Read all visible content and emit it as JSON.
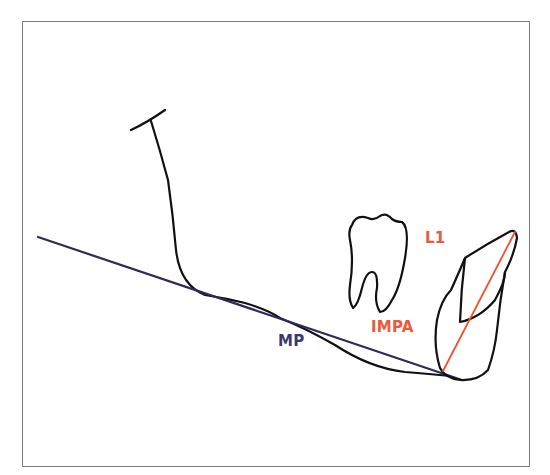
{
  "diagram": {
    "labels": {
      "l1": "L1",
      "impa": "IMPA",
      "mp": "MP"
    },
    "colors": {
      "frame": "#7a7a7a",
      "outline": "#111111",
      "mandibular_plane": "#2e2b5c",
      "incisor_axis": "#f0502a",
      "label_red": "#e85a3a",
      "label_navy": "#3c3a6a"
    },
    "elements": [
      "mandible-outline",
      "mandibular-plane-line",
      "molar-tooth",
      "lower-incisor",
      "incisor-long-axis"
    ]
  }
}
